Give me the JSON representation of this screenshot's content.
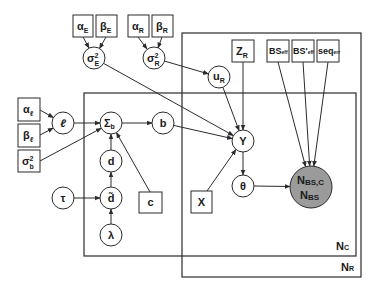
{
  "diagram": {
    "type": "plate-notation graphical model",
    "plates": {
      "inner": {
        "symbol": "N",
        "sub": "C"
      },
      "outer": {
        "symbol": "N",
        "sub": "R"
      }
    },
    "nodes": {
      "alpha_E": {
        "symbol": "α",
        "sub": "E",
        "shape": "box"
      },
      "beta_E": {
        "symbol": "β",
        "sub": "E",
        "shape": "box"
      },
      "alpha_R": {
        "symbol": "α",
        "sub": "R",
        "shape": "box"
      },
      "beta_R": {
        "symbol": "β",
        "sub": "R",
        "shape": "box"
      },
      "sigma2_E": {
        "symbol": "σ",
        "sup": "2",
        "sub": "E",
        "shape": "circle"
      },
      "sigma2_R": {
        "symbol": "σ",
        "sup": "2",
        "sub": "R",
        "shape": "circle"
      },
      "u_R": {
        "symbol": "u",
        "sub": "R",
        "shape": "circle"
      },
      "Z_R": {
        "symbol": "Z",
        "sub": "R",
        "shape": "box"
      },
      "BS_eff": {
        "symbol": "BS",
        "sub": "eff",
        "shape": "box"
      },
      "BSprime_eff": {
        "symbol": "BS'",
        "sub": "eff",
        "shape": "box"
      },
      "seq_err": {
        "symbol": "seq",
        "sub": "err",
        "shape": "box"
      },
      "alpha_l": {
        "symbol": "α",
        "sub": "ℓ",
        "shape": "box"
      },
      "beta_l": {
        "symbol": "β",
        "sub": "ℓ",
        "shape": "box"
      },
      "sigma2_b": {
        "symbol": "σ",
        "sup": "2",
        "sub": "b",
        "shape": "box"
      },
      "ell": {
        "symbol": "ℓ",
        "shape": "circle"
      },
      "Sigma_b": {
        "symbol": "Σ",
        "sub": "b",
        "shape": "circle"
      },
      "b": {
        "symbol": "b",
        "shape": "circle"
      },
      "d": {
        "symbol": "d",
        "shape": "circle"
      },
      "d_tilde": {
        "symbol": "d̃",
        "shape": "circle"
      },
      "tau": {
        "symbol": "τ",
        "shape": "circle"
      },
      "lambda": {
        "symbol": "λ",
        "shape": "circle"
      },
      "c": {
        "symbol": "c",
        "shape": "box"
      },
      "Y": {
        "symbol": "Y",
        "shape": "circle"
      },
      "theta": {
        "symbol": "θ",
        "shape": "circle"
      },
      "X": {
        "symbol": "X",
        "shape": "box"
      },
      "N_BS": {
        "line1": {
          "symbol": "N",
          "sub": "BS,C"
        },
        "line2": {
          "symbol": "N",
          "sub": "BS"
        },
        "shape": "circle",
        "observed": true,
        "fill": "#9b9b9b"
      }
    },
    "edges": [
      [
        "alpha_E",
        "sigma2_E"
      ],
      [
        "beta_E",
        "sigma2_E"
      ],
      [
        "alpha_R",
        "sigma2_R"
      ],
      [
        "beta_R",
        "sigma2_R"
      ],
      [
        "sigma2_E",
        "Y"
      ],
      [
        "sigma2_R",
        "u_R"
      ],
      [
        "u_R",
        "Y"
      ],
      [
        "Z_R",
        "Y"
      ],
      [
        "BS_eff",
        "N_BS"
      ],
      [
        "BSprime_eff",
        "N_BS"
      ],
      [
        "seq_err",
        "N_BS"
      ],
      [
        "alpha_l",
        "ell"
      ],
      [
        "beta_l",
        "ell"
      ],
      [
        "ell",
        "Sigma_b"
      ],
      [
        "sigma2_b",
        "Sigma_b"
      ],
      [
        "d",
        "Sigma_b"
      ],
      [
        "c",
        "Sigma_b"
      ],
      [
        "Sigma_b",
        "b"
      ],
      [
        "b",
        "Y"
      ],
      [
        "X",
        "Y"
      ],
      [
        "Y",
        "theta"
      ],
      [
        "theta",
        "N_BS"
      ],
      [
        "tau",
        "d_tilde"
      ],
      [
        "lambda",
        "d_tilde"
      ],
      [
        "d_tilde",
        "d"
      ]
    ]
  }
}
